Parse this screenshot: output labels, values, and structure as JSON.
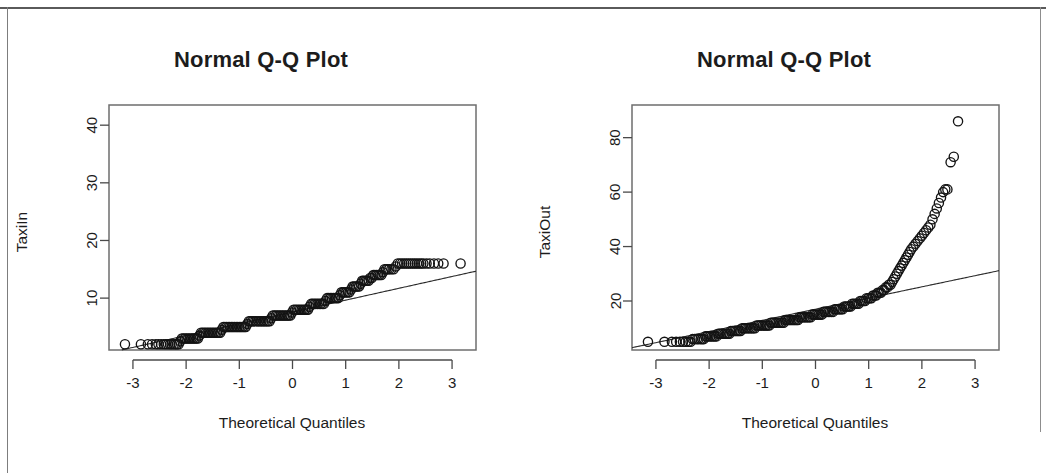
{
  "page": {
    "background_color": "#ffffff",
    "frame_color": "#5a5a5a",
    "width": 1046,
    "height": 473
  },
  "panels": [
    {
      "id": "taxiin",
      "title": "Normal Q-Q Plot",
      "ylabel": "TaxiIn",
      "xlabel": "Theoretical Quantiles"
    },
    {
      "id": "taxiout",
      "title": "Normal Q-Q Plot",
      "ylabel": "TaxiOut",
      "xlabel": "Theoretical Quantiles"
    }
  ],
  "chart_data": [
    {
      "type": "scatter",
      "id": "taxiin-qq",
      "title": "Normal Q-Q Plot",
      "xlabel": "Theoretical Quantiles",
      "ylabel": "TaxiIn",
      "grid": false,
      "legend": null,
      "xlim": [
        -3.45,
        3.45
      ],
      "ylim": [
        1.0,
        43.5
      ],
      "xticks": [
        -3,
        -2,
        -1,
        0,
        1,
        2,
        3
      ],
      "xtick_labels": [
        "-3",
        "-2",
        "-1",
        "0",
        "1",
        "2",
        "3"
      ],
      "yticks": [
        10,
        20,
        30,
        40
      ],
      "ytick_labels": [
        "10",
        "20",
        "30",
        "40"
      ],
      "reference_line": {
        "slope": 2.05,
        "intercept": 7.6
      },
      "x": [
        -3.15,
        -2.85,
        -2.72,
        -2.64,
        -2.57,
        -2.52,
        -2.47,
        -2.42,
        -2.38,
        -2.34,
        -2.3,
        -2.27,
        -2.23,
        -2.2,
        -2.17,
        -2.14,
        -2.11,
        -2.08,
        -2.05,
        -2.02,
        -1.99,
        -1.96,
        -1.93,
        -1.9,
        -1.87,
        -1.84,
        -1.81,
        -1.78,
        -1.75,
        -1.72,
        -1.69,
        -1.66,
        -1.63,
        -1.6,
        -1.57,
        -1.54,
        -1.51,
        -1.48,
        -1.45,
        -1.42,
        -1.39,
        -1.36,
        -1.33,
        -1.3,
        -1.27,
        -1.24,
        -1.21,
        -1.18,
        -1.15,
        -1.12,
        -1.09,
        -1.06,
        -1.03,
        -1.0,
        -0.97,
        -0.94,
        -0.91,
        -0.88,
        -0.85,
        -0.82,
        -0.79,
        -0.76,
        -0.73,
        -0.7,
        -0.67,
        -0.64,
        -0.61,
        -0.58,
        -0.55,
        -0.52,
        -0.49,
        -0.46,
        -0.43,
        -0.4,
        -0.37,
        -0.34,
        -0.31,
        -0.28,
        -0.25,
        -0.22,
        -0.19,
        -0.16,
        -0.13,
        -0.1,
        -0.07,
        -0.04,
        -0.01,
        0.02,
        0.05,
        0.08,
        0.11,
        0.14,
        0.17,
        0.2,
        0.23,
        0.26,
        0.29,
        0.32,
        0.35,
        0.38,
        0.41,
        0.44,
        0.47,
        0.5,
        0.53,
        0.56,
        0.59,
        0.62,
        0.65,
        0.68,
        0.71,
        0.74,
        0.77,
        0.8,
        0.83,
        0.86,
        0.89,
        0.92,
        0.95,
        0.98,
        1.01,
        1.04,
        1.07,
        1.1,
        1.13,
        1.16,
        1.19,
        1.22,
        1.25,
        1.28,
        1.31,
        1.34,
        1.37,
        1.4,
        1.43,
        1.46,
        1.49,
        1.52,
        1.55,
        1.58,
        1.61,
        1.64,
        1.67,
        1.7,
        1.73,
        1.76,
        1.79,
        1.82,
        1.86,
        1.9,
        1.94,
        1.98,
        2.02,
        2.06,
        2.1,
        2.14,
        2.18,
        2.22,
        2.26,
        2.3,
        2.34,
        2.38,
        2.42,
        2.46,
        2.52,
        2.58,
        2.66,
        2.74,
        2.84,
        3.16
      ],
      "y": [
        2.0,
        2.0,
        2.0,
        2.0,
        2.0,
        2.0,
        2.0,
        2.0,
        2.0,
        2.0,
        2.0,
        2.0,
        2.0,
        2.0,
        2.0,
        2.0,
        2.5,
        3.0,
        3.0,
        3.0,
        3.0,
        3.0,
        3.0,
        3.0,
        3.0,
        3.0,
        3.0,
        3.0,
        3.5,
        4.0,
        4.0,
        4.0,
        4.0,
        4.0,
        4.0,
        4.0,
        4.0,
        4.0,
        4.0,
        4.0,
        4.0,
        4.0,
        4.5,
        5.0,
        5.0,
        5.0,
        5.0,
        5.0,
        5.0,
        5.0,
        5.0,
        5.0,
        5.0,
        5.0,
        5.0,
        5.0,
        5.0,
        5.0,
        5.5,
        6.0,
        6.0,
        6.0,
        6.0,
        6.0,
        6.0,
        6.0,
        6.0,
        6.0,
        6.0,
        6.0,
        6.0,
        6.0,
        6.0,
        6.5,
        7.0,
        7.0,
        7.0,
        7.0,
        7.0,
        7.0,
        7.0,
        7.0,
        7.0,
        7.0,
        7.0,
        7.0,
        7.5,
        8.0,
        8.0,
        8.0,
        8.0,
        8.0,
        8.0,
        8.0,
        8.0,
        8.0,
        8.0,
        8.5,
        9.0,
        9.0,
        9.0,
        9.0,
        9.0,
        9.0,
        9.0,
        9.0,
        9.0,
        9.5,
        10.0,
        10.0,
        10.0,
        10.0,
        10.0,
        10.0,
        10.0,
        10.0,
        10.5,
        11.0,
        11.0,
        11.0,
        11.0,
        11.0,
        11.0,
        11.5,
        12.0,
        12.0,
        12.0,
        12.0,
        12.0,
        12.5,
        13.0,
        13.0,
        13.0,
        13.0,
        13.0,
        13.5,
        13.5,
        14.0,
        14.0,
        14.0,
        14.0,
        14.0,
        14.0,
        14.5,
        15.0,
        15.0,
        15.0,
        15.0,
        15.0,
        15.0,
        15.5,
        16.0,
        16.0,
        16.0,
        16.0,
        16.0,
        16.0,
        16.0,
        16.0,
        16.0,
        16.0,
        16.0,
        16.0,
        16.0,
        16.0,
        16.0,
        16.0,
        16.0,
        16.0,
        16.0,
        19.0,
        20.0,
        22.0,
        23.0,
        41.0
      ]
    },
    {
      "type": "scatter",
      "id": "taxiout-qq",
      "title": "Normal Q-Q Plot",
      "xlabel": "Theoretical Quantiles",
      "ylabel": "TaxiOut",
      "grid": false,
      "legend": null,
      "xlim": [
        -3.45,
        3.45
      ],
      "ylim": [
        2.0,
        92.0
      ],
      "xticks": [
        -3,
        -2,
        -1,
        0,
        1,
        2,
        3
      ],
      "xtick_labels": [
        "-3",
        "-2",
        "-1",
        "0",
        "1",
        "2",
        "3"
      ],
      "yticks": [
        20,
        40,
        60,
        80
      ],
      "ytick_labels": [
        "20",
        "40",
        "60",
        "80"
      ],
      "reference_line": {
        "slope": 4.1,
        "intercept": 17.0
      },
      "x": [
        -3.15,
        -2.84,
        -2.7,
        -2.62,
        -2.55,
        -2.49,
        -2.44,
        -2.39,
        -2.35,
        -2.31,
        -2.27,
        -2.23,
        -2.2,
        -2.16,
        -2.13,
        -2.1,
        -2.07,
        -2.04,
        -2.01,
        -1.98,
        -1.95,
        -1.92,
        -1.89,
        -1.86,
        -1.83,
        -1.8,
        -1.77,
        -1.74,
        -1.71,
        -1.68,
        -1.65,
        -1.62,
        -1.59,
        -1.56,
        -1.53,
        -1.5,
        -1.47,
        -1.44,
        -1.41,
        -1.38,
        -1.35,
        -1.32,
        -1.29,
        -1.26,
        -1.23,
        -1.2,
        -1.17,
        -1.14,
        -1.11,
        -1.08,
        -1.05,
        -1.02,
        -0.99,
        -0.96,
        -0.93,
        -0.9,
        -0.87,
        -0.84,
        -0.81,
        -0.78,
        -0.75,
        -0.72,
        -0.69,
        -0.66,
        -0.63,
        -0.6,
        -0.57,
        -0.54,
        -0.51,
        -0.48,
        -0.45,
        -0.42,
        -0.39,
        -0.36,
        -0.33,
        -0.3,
        -0.27,
        -0.24,
        -0.21,
        -0.18,
        -0.15,
        -0.12,
        -0.09,
        -0.06,
        -0.03,
        0.0,
        0.03,
        0.06,
        0.09,
        0.12,
        0.15,
        0.18,
        0.21,
        0.24,
        0.27,
        0.3,
        0.33,
        0.36,
        0.39,
        0.42,
        0.45,
        0.48,
        0.51,
        0.54,
        0.57,
        0.6,
        0.63,
        0.66,
        0.69,
        0.72,
        0.75,
        0.78,
        0.81,
        0.84,
        0.87,
        0.9,
        0.93,
        0.96,
        0.99,
        1.02,
        1.05,
        1.08,
        1.11,
        1.14,
        1.17,
        1.2,
        1.23,
        1.26,
        1.29,
        1.32,
        1.35,
        1.38,
        1.41,
        1.44,
        1.47,
        1.5,
        1.53,
        1.56,
        1.59,
        1.62,
        1.65,
        1.68,
        1.71,
        1.74,
        1.77,
        1.8,
        1.84,
        1.88,
        1.92,
        1.96,
        2.0,
        2.04,
        2.08,
        2.12,
        2.16,
        2.2,
        2.24,
        2.28,
        2.32,
        2.36,
        2.4,
        2.44,
        2.48,
        2.54,
        2.6,
        2.68,
        2.8,
        3.17
      ],
      "y": [
        5.0,
        5.0,
        5.0,
        5.0,
        5.0,
        5.0,
        5.0,
        5.0,
        5.0,
        6.0,
        6.0,
        6.0,
        6.0,
        6.0,
        6.0,
        6.0,
        7.0,
        7.0,
        7.0,
        7.0,
        7.0,
        7.0,
        7.0,
        7.0,
        8.0,
        8.0,
        8.0,
        8.0,
        8.0,
        8.0,
        8.0,
        8.0,
        9.0,
        9.0,
        9.0,
        9.0,
        9.0,
        9.0,
        9.0,
        10.0,
        10.0,
        10.0,
        10.0,
        10.0,
        10.0,
        10.0,
        10.0,
        10.0,
        11.0,
        11.0,
        11.0,
        11.0,
        11.0,
        11.0,
        11.0,
        11.0,
        11.0,
        12.0,
        12.0,
        12.0,
        12.0,
        12.0,
        12.0,
        12.0,
        12.0,
        12.0,
        13.0,
        13.0,
        13.0,
        13.0,
        13.0,
        13.0,
        13.0,
        13.0,
        13.0,
        14.0,
        14.0,
        14.0,
        14.0,
        14.0,
        14.0,
        14.0,
        14.0,
        15.0,
        15.0,
        15.0,
        15.0,
        15.0,
        15.0,
        15.0,
        16.0,
        16.0,
        16.0,
        16.0,
        16.0,
        16.0,
        16.0,
        17.0,
        17.0,
        17.0,
        17.0,
        17.0,
        17.0,
        18.0,
        18.0,
        18.0,
        18.0,
        18.0,
        19.0,
        19.0,
        19.0,
        19.0,
        19.0,
        20.0,
        20.0,
        20.0,
        20.0,
        21.0,
        21.0,
        21.0,
        21.0,
        22.0,
        22.0,
        22.0,
        23.0,
        23.0,
        23.0,
        24.0,
        24.0,
        25.0,
        25.0,
        26.0,
        26.0,
        27.0,
        28.0,
        29.0,
        30.0,
        31.0,
        32.0,
        33.0,
        34.0,
        35.0,
        36.0,
        37.0,
        38.0,
        39.0,
        40.0,
        41.0,
        42.0,
        43.0,
        44.0,
        45.0,
        46.0,
        47.0,
        48.0,
        50.0,
        52.0,
        54.0,
        56.0,
        58.0,
        60.0,
        61.0,
        61.0,
        71.0,
        73.0,
        86.0
      ]
    }
  ]
}
